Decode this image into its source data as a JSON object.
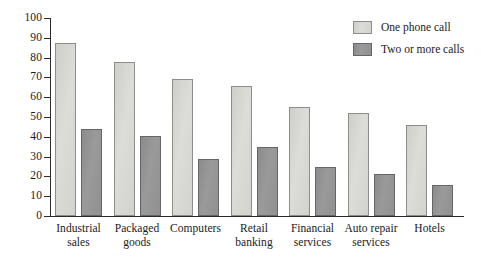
{
  "chart_data": {
    "type": "bar",
    "title": "",
    "subtitle": "",
    "xlabel": "",
    "ylabel": "",
    "ylim": [
      0,
      100
    ],
    "ytick_step": 10,
    "yticks": [
      0,
      10,
      20,
      30,
      40,
      50,
      60,
      70,
      80,
      90,
      100
    ],
    "grid": false,
    "legend_position": "top-right",
    "categories": [
      "Industrial sales",
      "Packaged goods",
      "Computers",
      "Retail banking",
      "Financial services",
      "Auto repair services",
      "Hotels"
    ],
    "category_lines": [
      [
        "Industrial",
        "sales"
      ],
      [
        "Packaged",
        "goods"
      ],
      [
        "Computers"
      ],
      [
        "Retail",
        "banking"
      ],
      [
        "Financial",
        "services"
      ],
      [
        "Auto repair",
        "services"
      ],
      [
        "Hotels"
      ]
    ],
    "series": [
      {
        "name": "One phone call",
        "color": "#d7d7d3",
        "values": [
          87.5,
          78,
          69,
          65.5,
          55,
          52,
          46
        ]
      },
      {
        "name": "Two or more calls",
        "color": "#939393",
        "values": [
          44,
          40.5,
          29,
          35,
          25,
          21,
          15.5
        ]
      }
    ]
  },
  "legend": {
    "items": [
      {
        "label": "One phone call",
        "swatch": "light"
      },
      {
        "label": "Two or more calls",
        "swatch": "dark"
      }
    ]
  },
  "axis": {
    "y_tick_labels": [
      "100",
      "90",
      "80",
      "70",
      "60",
      "50",
      "40",
      "30",
      "20",
      "10",
      "0"
    ]
  },
  "colors": {
    "series_one": "#d7d7d3",
    "series_two": "#939393",
    "axis": "#2b2b2b",
    "text": "#1a1a1a",
    "background": "#ffffff"
  }
}
